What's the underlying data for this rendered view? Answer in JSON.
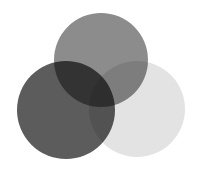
{
  "diagram": {
    "type": "venn",
    "sets": [
      {
        "name": "top-circle",
        "cx": 101,
        "cy": 60,
        "r": 47,
        "color": "#8c8c8c"
      },
      {
        "name": "left-circle",
        "cx": 66,
        "cy": 110,
        "r": 49,
        "color": "#5c5c5c"
      },
      {
        "name": "right-circle",
        "cx": 137,
        "cy": 109,
        "r": 48,
        "color": "#e3e3e3"
      }
    ]
  }
}
